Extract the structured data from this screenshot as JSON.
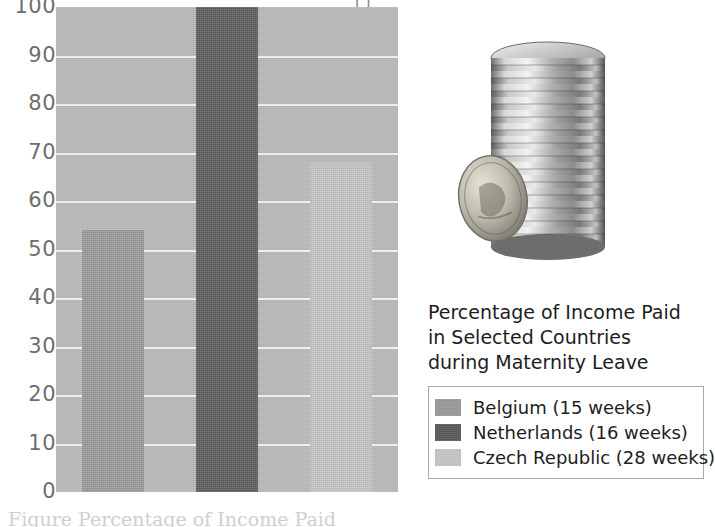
{
  "figure": {
    "caption_lines": [
      "Percentage of Income Paid",
      "in Selected Countries",
      "during Maternity Leave"
    ],
    "top_clipped_text": "11",
    "bottom_clipped_text": "Figure    Percentage of Income Paid"
  },
  "chart_data": {
    "type": "bar",
    "title": "Percentage of Income Paid in Selected Countries during Maternity Leave",
    "xlabel": "",
    "ylabel": "",
    "ylim": [
      0,
      100
    ],
    "ytick_labels": [
      "100",
      "90",
      "80",
      "70",
      "60",
      "50",
      "40",
      "30",
      "20",
      "10",
      "0"
    ],
    "ytick_values": [
      100,
      90,
      80,
      70,
      60,
      50,
      40,
      30,
      20,
      10,
      0
    ],
    "grid": true,
    "legend_position": "right",
    "categories": [
      "Belgium (15 weeks)",
      "Netherlands (16 weeks)",
      "Czech Republic (28 weeks)"
    ],
    "values": [
      54,
      100,
      68
    ],
    "bar_colors": [
      "#9a9a9a",
      "#5c5c5c",
      "#c4c4c4"
    ],
    "plot_background": "#b9b9b9",
    "gridline_color": "#f2f2f2",
    "axis_label_color": "#6e6e6e"
  },
  "legend": {
    "items": [
      {
        "label": "Belgium (15 weeks)",
        "color": "#9a9a9a"
      },
      {
        "label": "Netherlands (16 weeks)",
        "color": "#5c5c5c"
      },
      {
        "label": "Czech Republic (28 weeks)",
        "color": "#c4c4c4"
      }
    ]
  },
  "photo": {
    "name": "coin-stack-photo",
    "description": "Stack of silver coins with one coin leaning in front"
  }
}
